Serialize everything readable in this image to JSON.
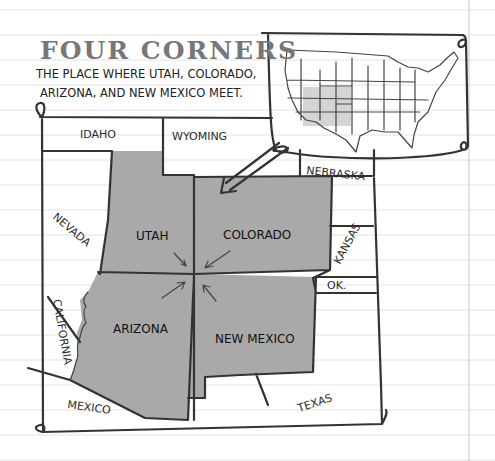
{
  "title": "FOUR CORNERS",
  "subtitle": {
    "line1": "THE PLACE WHERE UTAH, COLORADO,",
    "line2": "ARIZONA, AND NEW MEXICO MEET."
  },
  "highlighted_states": [
    {
      "id": "utah",
      "label": "UTAH"
    },
    {
      "id": "colorado",
      "label": "COLORADO"
    },
    {
      "id": "arizona",
      "label": "ARIZONA"
    },
    {
      "id": "new-mexico",
      "label": "NEW MEXICO"
    }
  ],
  "neighbor_labels": {
    "idaho": "IDAHO",
    "wyoming": "WYOMING",
    "nebraska": "NEBRASKA",
    "nevada": "NEVADA",
    "kansas": "KANSAS",
    "oklahoma": "OK.",
    "california": "CALIFORNIA",
    "mexico": "MEXICO",
    "texas": "TEXAS"
  },
  "inset": {
    "description": "Outline map of the United States with the four corners states shaded",
    "highlight_color": "#c8c8c8"
  },
  "colors": {
    "state_fill": "#a9a9a9",
    "ink": "#333333",
    "title": "#777777",
    "paper_rule": "#e2e2e2"
  }
}
